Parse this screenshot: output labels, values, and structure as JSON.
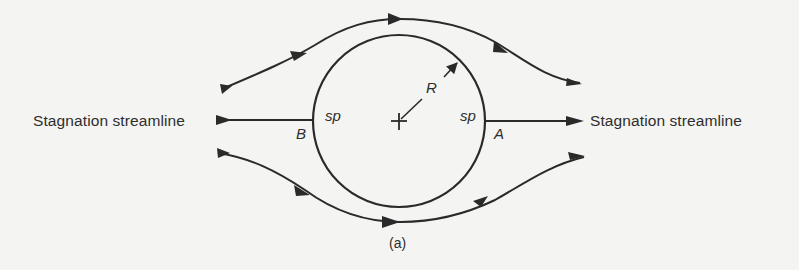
{
  "figure": {
    "caption": "(a)",
    "left_label": "Stagnation streamline",
    "right_label": "Stagnation streamline",
    "point_labels": {
      "left_point": "B",
      "right_point": "A",
      "left_sp": "sp",
      "right_sp": "sp",
      "radius": "R"
    },
    "elements": {
      "cylinder": "circle",
      "center_marker": "+",
      "streamlines": [
        "upper streamline",
        "lower streamline",
        "left stagnation streamline",
        "right stagnation streamline"
      ]
    },
    "colors": {
      "ink": "#2a2a2a",
      "background": "#f4f4f2"
    }
  }
}
